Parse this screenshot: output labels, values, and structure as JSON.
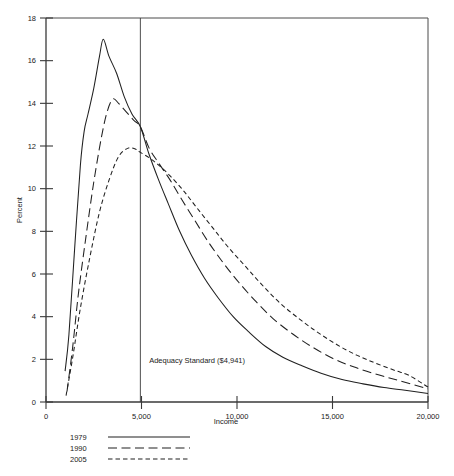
{
  "chart_data": {
    "type": "line",
    "title": "",
    "xlabel": "Income",
    "ylabel": "Percent",
    "xlim": [
      0,
      20000
    ],
    "ylim": [
      0,
      18
    ],
    "grid": false,
    "legend_position": "below-axes-left",
    "x_ticks": [
      0,
      5000,
      10000,
      15000,
      20000
    ],
    "x_tick_labels": [
      "0",
      "5,000",
      "10,000",
      "15,000",
      "20,000"
    ],
    "y_ticks": [
      0,
      2,
      4,
      6,
      8,
      10,
      12,
      14,
      16,
      18
    ],
    "y_tick_labels": [
      "0",
      "2",
      "4",
      "6",
      "8",
      "10",
      "12",
      "14",
      "16",
      "18"
    ],
    "annotations": [
      {
        "name": "adequacy-standard",
        "text": "Adequacy Standard ($4,941)",
        "x": 4941,
        "type": "vertical-line-with-label",
        "label_x": 5400,
        "label_y": 1.85
      }
    ],
    "series": [
      {
        "name": "1979",
        "style": "solid",
        "x": [
          1000,
          1200,
          1500,
          1800,
          2000,
          2200,
          2500,
          2800,
          3000,
          3300,
          3700,
          4100,
          4500,
          4941,
          5400,
          5900,
          6400,
          7000,
          7600,
          8300,
          9000,
          9800,
          10600,
          11500,
          12400,
          13400,
          14400,
          15500,
          16600,
          17700,
          18800,
          20000
        ],
        "y": [
          1.45,
          3.15,
          7.2,
          11.1,
          12.7,
          13.5,
          14.7,
          16.2,
          17.0,
          16.2,
          15.4,
          14.3,
          13.5,
          12.9,
          11.6,
          10.4,
          9.3,
          8.0,
          6.9,
          5.8,
          4.9,
          4.0,
          3.3,
          2.6,
          2.1,
          1.7,
          1.35,
          1.05,
          0.85,
          0.68,
          0.55,
          0.4
        ]
      },
      {
        "name": "1990",
        "style": "long-dash",
        "x": [
          1100,
          1400,
          1700,
          2100,
          2500,
          2900,
          3200,
          3500,
          3800,
          4200,
          4600,
          4941,
          5400,
          5900,
          6500,
          7100,
          7800,
          8500,
          9300,
          10100,
          11000,
          11900,
          12900,
          13900,
          15000,
          16100,
          17300,
          18500,
          20000
        ],
        "y": [
          0.5,
          2.6,
          5.1,
          7.8,
          10.3,
          12.4,
          13.6,
          14.2,
          14.0,
          13.6,
          13.2,
          12.9,
          11.9,
          11.2,
          10.4,
          9.5,
          8.5,
          7.5,
          6.5,
          5.6,
          4.7,
          3.9,
          3.2,
          2.6,
          2.05,
          1.65,
          1.3,
          1.0,
          0.62
        ]
      },
      {
        "name": "2005",
        "style": "short-dash",
        "x": [
          1050,
          1400,
          1800,
          2300,
          2800,
          3300,
          3800,
          4300,
          4700,
          4941,
          5400,
          5900,
          6500,
          7200,
          7900,
          8700,
          9500,
          10400,
          11300,
          12300,
          13400,
          14500,
          15700,
          16900,
          18200,
          19000,
          20000
        ],
        "y": [
          0.3,
          2.1,
          4.4,
          6.8,
          8.9,
          10.4,
          11.5,
          11.9,
          11.85,
          11.7,
          11.45,
          11.1,
          10.6,
          9.9,
          9.1,
          8.2,
          7.3,
          6.4,
          5.5,
          4.6,
          3.8,
          3.1,
          2.45,
          1.95,
          1.5,
          1.25,
          0.7
        ]
      }
    ],
    "legend": [
      {
        "label": "1979",
        "style": "solid"
      },
      {
        "label": "1990",
        "style": "long-dash"
      },
      {
        "label": "2005",
        "style": "short-dash"
      }
    ]
  },
  "axes": {
    "ylabel": "Percent",
    "xlabel": "Income"
  }
}
